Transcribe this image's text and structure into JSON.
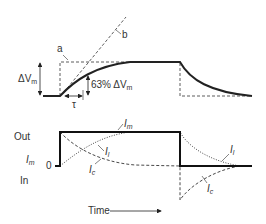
{
  "top_panel": {
    "delta_vm_label": "ΔV",
    "delta_vm_sub": "m",
    "label_a": "a",
    "label_b": "b",
    "tau_label": "τ",
    "pct_label": "63% ΔV",
    "pct_sub": "m"
  },
  "bottom_panel": {
    "out_label": "Out",
    "in_label": "In",
    "im_axis_label": "I",
    "im_axis_sub": "m",
    "zero_label": "0",
    "curve_im_label": "I",
    "curve_im_sub": "m",
    "curve_il_label": "I",
    "curve_il_sub": "l",
    "curve_ic_label": "I",
    "curve_ic_sub": "c",
    "curve_il2_label": "I",
    "curve_il2_sub": "l",
    "curve_ic2_label": "I",
    "curve_ic2_sub": "c",
    "time_label": "Time"
  },
  "colors": {
    "line": "#222222",
    "text": "#333333"
  }
}
